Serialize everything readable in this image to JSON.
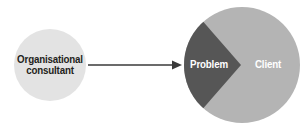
{
  "diagram": {
    "background_color": "#ffffff",
    "nodes": {
      "consultant": {
        "label": "Organisational\nconsultant",
        "label_line1": "Organisational",
        "label_line2": "consultant",
        "shape": "circle",
        "fill_color": "#e3e3e3",
        "text_color": "#231f20",
        "center_x": 50,
        "center_y": 65,
        "radius": 36
      },
      "client": {
        "label": "Client",
        "shape": "circle",
        "fill_color": "#b4b4b4",
        "text_color": "#ffffff",
        "center_x": 242,
        "center_y": 65,
        "radius": 58
      },
      "problem": {
        "label": "Problem",
        "shape": "wedge",
        "fill_color": "#565656",
        "text_color": "#ffffff",
        "apex_x": 241,
        "apex_y": 65
      }
    },
    "connector": {
      "type": "arrow",
      "label": "",
      "color": "#3a3a3a",
      "from": "consultant",
      "to": "problem",
      "start_x": 88,
      "end_x": 180,
      "y": 65
    }
  }
}
